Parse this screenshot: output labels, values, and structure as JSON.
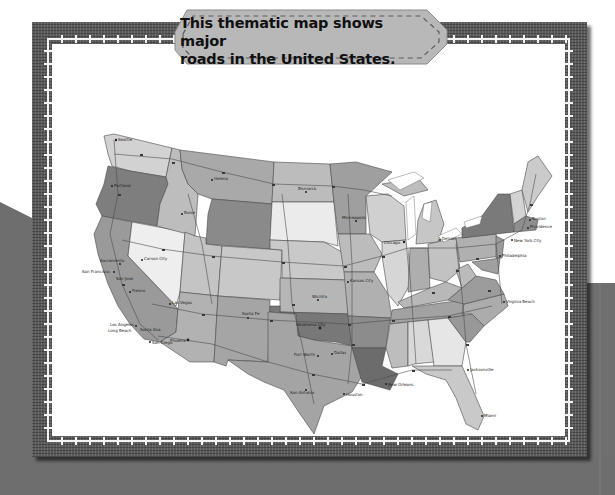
{
  "caption": {
    "line1": "This thematic map shows major",
    "line2": "roads in the United States."
  },
  "map": {
    "subject": "Major roads in the United States",
    "city_labels": [
      "Seattle",
      "Tacoma",
      "Portland",
      "Salem",
      "Boise",
      "Helena",
      "Sacramento",
      "San Francisco",
      "Oakland",
      "San Jose",
      "Carson City",
      "Fresno",
      "Las Vegas",
      "Los Angeles",
      "Long Beach",
      "Santa Ana",
      "Anaheim",
      "San Diego",
      "Phoenix",
      "Mesa",
      "Tucson",
      "Santa Fe",
      "Albuquerque",
      "El Paso",
      "Bismarck",
      "Pierre",
      "Minneapolis",
      "Saint Paul",
      "Wichita",
      "Topeka",
      "Kansas City",
      "Oklahoma City",
      "Tulsa",
      "Fort Worth",
      "Dallas",
      "Austin",
      "San Antonio",
      "Houston",
      "Baton Rouge",
      "New Orleans",
      "Jackson",
      "Jacksonville",
      "Tallahassee",
      "Miami",
      "Atlanta",
      "Columbia",
      "Raleigh",
      "Virginia Beach",
      "Richmond",
      "Washington",
      "Baltimore",
      "Philadelphia",
      "Jersey City",
      "New York City",
      "Providence",
      "Boston",
      "Concord",
      "Augusta",
      "Chicago",
      "Milwaukee",
      "Detroit",
      "Columbus",
      "Indianapolis",
      "Nashville",
      "Memphis"
    ],
    "colors": {
      "light": "#d9d9d9",
      "mid": "#b4b4b4",
      "dark": "#8c8c8c",
      "darker": "#767676",
      "lightest": "#ebebeb",
      "road": "#555555",
      "water": "#ffffff"
    }
  },
  "colors": {
    "frame": "#5a5a5a",
    "stitch": "#f4f4f4",
    "banner": "#b8b8b8",
    "background_gray": "#6e6e6e"
  }
}
